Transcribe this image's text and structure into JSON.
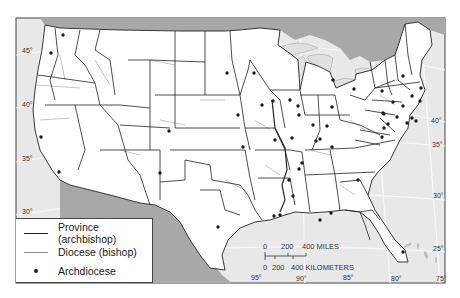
{
  "map": {
    "title": "Catholic ecclesiastical provinces of the United States",
    "colors": {
      "land": "#ffffff",
      "water": "#e8e8e8",
      "foreign_land": "#a8a8a8",
      "province_line": "#222222",
      "diocese_line": "#888888",
      "graticule": "#f7f7f7",
      "frame": "#444444"
    },
    "latitude_labels_left": [
      {
        "text": "45°",
        "x": 22,
        "y": 52
      },
      {
        "text": "40°",
        "x": 22,
        "y": 106
      },
      {
        "text": "35°",
        "x": 22,
        "y": 160
      },
      {
        "text": "30°",
        "x": 22,
        "y": 213
      }
    ],
    "latitude_labels_right": [
      {
        "text": "40°",
        "x": 431,
        "y": 122
      },
      {
        "text": "35°",
        "x": 432,
        "y": 146
      },
      {
        "text": "30°",
        "x": 433,
        "y": 197
      },
      {
        "text": "25°",
        "x": 433,
        "y": 250
      }
    ],
    "longitude_labels_bottom": [
      {
        "text": "95°",
        "x": 251,
        "y": 279
      },
      {
        "text": "90°",
        "x": 296,
        "y": 280
      },
      {
        "text": "85°",
        "x": 343,
        "y": 279
      },
      {
        "text": "80°",
        "x": 391,
        "y": 280
      },
      {
        "text": "75°",
        "x": 436,
        "y": 280
      }
    ],
    "archdiocese_points": [
      [
        63,
        35
      ],
      [
        51,
        53
      ],
      [
        41,
        137
      ],
      [
        59,
        172
      ],
      [
        169,
        131
      ],
      [
        160,
        173
      ],
      [
        218,
        227
      ],
      [
        227,
        73
      ],
      [
        238,
        115
      ],
      [
        243,
        147
      ],
      [
        254,
        73
      ],
      [
        262,
        105
      ],
      [
        273,
        101
      ],
      [
        275,
        140
      ],
      [
        290,
        100
      ],
      [
        292,
        138
      ],
      [
        298,
        106
      ],
      [
        313,
        125
      ],
      [
        316,
        141
      ],
      [
        327,
        126
      ],
      [
        332,
        107
      ],
      [
        320,
        139
      ],
      [
        333,
        80
      ],
      [
        354,
        89
      ],
      [
        302,
        163
      ],
      [
        332,
        147
      ],
      [
        299,
        169
      ],
      [
        289,
        180
      ],
      [
        274,
        216
      ],
      [
        331,
        213
      ],
      [
        293,
        196
      ],
      [
        320,
        220
      ],
      [
        382,
        91
      ],
      [
        393,
        102
      ],
      [
        397,
        117
      ],
      [
        388,
        124
      ],
      [
        384,
        128
      ],
      [
        382,
        137
      ],
      [
        403,
        106
      ],
      [
        412,
        118
      ],
      [
        407,
        123
      ],
      [
        416,
        121
      ],
      [
        403,
        76
      ],
      [
        412,
        96
      ],
      [
        421,
        88
      ],
      [
        384,
        114
      ],
      [
        358,
        180
      ],
      [
        383,
        113
      ],
      [
        420,
        101
      ],
      [
        280,
        215
      ],
      [
        403,
        252
      ],
      [
        299,
        115
      ]
    ]
  },
  "legend": {
    "items": [
      {
        "label": "Province (archbishop)",
        "symbol": "solid-dark-line"
      },
      {
        "label": "Diocese (bishop)",
        "symbol": "solid-gray-line"
      },
      {
        "label": "Archdiocese",
        "symbol": "dot"
      }
    ]
  },
  "scale_bar": {
    "miles_ticks": [
      "0",
      "200",
      "400 MILES"
    ],
    "km_ticks": [
      "0",
      "200",
      "400 KILOMETERS"
    ]
  }
}
